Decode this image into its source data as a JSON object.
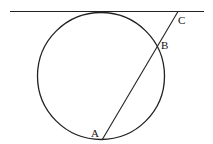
{
  "diagram": {
    "points": [
      {
        "id": "A",
        "label": "A"
      },
      {
        "id": "B",
        "label": "B"
      },
      {
        "id": "C",
        "label": "C"
      }
    ],
    "elements": [
      "circle",
      "tangent-line",
      "segment-AC"
    ],
    "stroke_color": "#222222",
    "background": "#ffffff"
  }
}
